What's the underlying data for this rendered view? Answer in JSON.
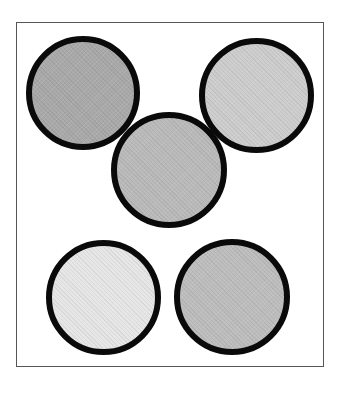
{
  "figure": {
    "frame": {
      "border_color": "#555555",
      "background": "#ffffff"
    },
    "circles": [
      {
        "id": "top-left",
        "cx": 83,
        "cy": 93,
        "diameter": 114,
        "fill": "#a9a9a9",
        "border": "#0a0a0a"
      },
      {
        "id": "top-right",
        "cx": 256,
        "cy": 95,
        "diameter": 115,
        "fill": "#cdcdcd",
        "border": "#0a0a0a"
      },
      {
        "id": "middle",
        "cx": 169,
        "cy": 170,
        "diameter": 116,
        "fill": "#bababa",
        "border": "#0a0a0a"
      },
      {
        "id": "bottom-left",
        "cx": 103,
        "cy": 297,
        "diameter": 115,
        "fill": "#e6e6e6",
        "border": "#0a0a0a"
      },
      {
        "id": "bottom-right",
        "cx": 232,
        "cy": 297,
        "diameter": 116,
        "fill": "#bdbdbd",
        "border": "#0a0a0a"
      }
    ]
  }
}
